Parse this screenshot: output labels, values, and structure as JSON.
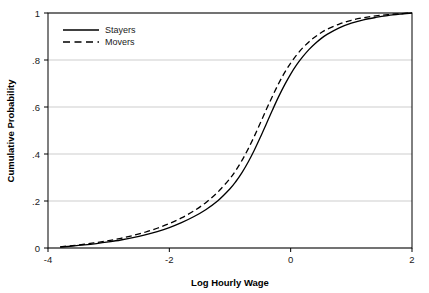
{
  "chart_data": {
    "type": "line",
    "title": "",
    "subtitle": "",
    "xlabel": "Log Hourly Wage",
    "ylabel": "Cumulative Probability",
    "xlim": [
      -4,
      2
    ],
    "ylim": [
      0,
      1
    ],
    "xticks": [
      -4,
      -2,
      0,
      2
    ],
    "xtick_labels": [
      "-4",
      "-2",
      "0",
      "2"
    ],
    "yticks": [
      0,
      0.2,
      0.4,
      0.6,
      0.8,
      1
    ],
    "ytick_labels": [
      "0",
      ".2",
      ".4",
      ".6",
      ".8",
      "1"
    ],
    "grid": "horizontal",
    "grid_color": "#b8b8b8",
    "axis_color": "#000000",
    "background": "#ffffff",
    "legend_position": "top-left",
    "series": [
      {
        "name": "Stayers",
        "style": "solid",
        "color": "#000000",
        "x": [
          -3.8,
          -3.6,
          -3.4,
          -3.2,
          -3.0,
          -2.8,
          -2.6,
          -2.4,
          -2.2,
          -2.0,
          -1.8,
          -1.6,
          -1.4,
          -1.2,
          -1.0,
          -0.9,
          -0.8,
          -0.7,
          -0.6,
          -0.5,
          -0.4,
          -0.3,
          -0.2,
          -0.1,
          0.0,
          0.1,
          0.2,
          0.3,
          0.4,
          0.5,
          0.6,
          0.8,
          1.0,
          1.2,
          1.4,
          1.6,
          1.8,
          2.0
        ],
        "y": [
          0.004,
          0.008,
          0.013,
          0.019,
          0.026,
          0.034,
          0.044,
          0.056,
          0.07,
          0.087,
          0.108,
          0.133,
          0.163,
          0.201,
          0.252,
          0.284,
          0.322,
          0.366,
          0.416,
          0.471,
          0.529,
          0.587,
          0.643,
          0.694,
          0.74,
          0.78,
          0.814,
          0.844,
          0.869,
          0.891,
          0.909,
          0.937,
          0.957,
          0.971,
          0.981,
          0.989,
          0.995,
          1.0
        ]
      },
      {
        "name": "Movers",
        "style": "dashed",
        "color": "#000000",
        "x": [
          -3.8,
          -3.6,
          -3.4,
          -3.2,
          -3.0,
          -2.8,
          -2.6,
          -2.4,
          -2.2,
          -2.0,
          -1.8,
          -1.6,
          -1.4,
          -1.2,
          -1.0,
          -0.9,
          -0.8,
          -0.7,
          -0.6,
          -0.5,
          -0.4,
          -0.3,
          -0.2,
          -0.1,
          0.0,
          0.1,
          0.2,
          0.3,
          0.4,
          0.5,
          0.6,
          0.8,
          1.0,
          1.2,
          1.4,
          1.6,
          1.8,
          2.0
        ],
        "y": [
          0.005,
          0.01,
          0.016,
          0.023,
          0.031,
          0.041,
          0.053,
          0.067,
          0.084,
          0.104,
          0.128,
          0.157,
          0.193,
          0.238,
          0.296,
          0.332,
          0.374,
          0.422,
          0.475,
          0.532,
          0.59,
          0.646,
          0.699,
          0.746,
          0.787,
          0.822,
          0.852,
          0.877,
          0.898,
          0.916,
          0.931,
          0.953,
          0.969,
          0.98,
          0.988,
          0.993,
          0.997,
          1.0
        ]
      }
    ]
  },
  "legend": {
    "items": [
      {
        "label": "Stayers",
        "style": "solid"
      },
      {
        "label": "Movers",
        "style": "dashed"
      }
    ]
  }
}
